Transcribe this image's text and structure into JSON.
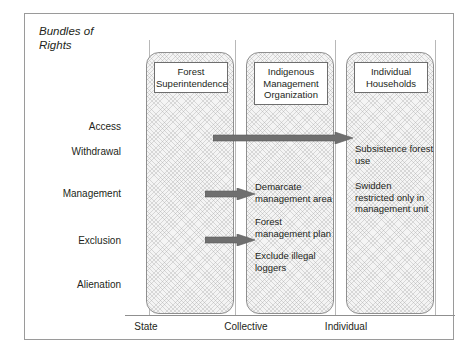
{
  "figure": {
    "title": "Bundles of\nRights"
  },
  "rights_rows": [
    {
      "label": "Access",
      "top": 107
    },
    {
      "label": "Withdrawal",
      "top": 132
    },
    {
      "label": "Management",
      "top": 174
    },
    {
      "label": "Exclusion",
      "top": 221
    },
    {
      "label": "Alienation",
      "top": 265
    }
  ],
  "tiers": [
    {
      "key": "state",
      "header": "Forest\nSuperintendence",
      "caption": "State",
      "notes": []
    },
    {
      "key": "collective",
      "header": "Indigenous\nManagement\nOrganization",
      "caption": "Collective",
      "notes": [
        {
          "text": "Demarcate\nmanagement area",
          "top": 128
        },
        {
          "text": "Forest\nmanagement plan",
          "top": 163
        },
        {
          "text": "Exclude illegal\nloggers",
          "top": 197
        }
      ]
    },
    {
      "key": "individual",
      "header": "Individual\nHouseholds",
      "caption": "Individual",
      "notes": [
        {
          "text": "Subsistence forest\nuse",
          "top": 90
        },
        {
          "text": "Swidden\nrestricted only in\nmanagement unit",
          "top": 127
        }
      ]
    }
  ],
  "arrows": [
    {
      "name": "arrow-state-to-individual",
      "left": 88,
      "top": 92,
      "width": 140,
      "from": "Forest Superintendence",
      "to": "Individual Households"
    },
    {
      "name": "arrow-state-to-collective-management",
      "left": 80,
      "top": 148,
      "width": 50,
      "from": "Forest Superintendence",
      "to": "Indigenous Management Organization"
    },
    {
      "name": "arrow-state-to-collective-exclusion",
      "left": 80,
      "top": 194,
      "width": 50,
      "from": "Forest Superintendence",
      "to": "Indigenous Management Organization"
    }
  ],
  "colors": {
    "frame_border": "#9a9a9a",
    "column_border": "#8f8f8f",
    "column_fill": "#f4f4f4",
    "arrow_fill": "#6f6f6f",
    "text": "#231f20"
  }
}
